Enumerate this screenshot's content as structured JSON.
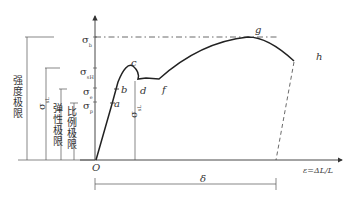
{
  "diagram": {
    "type": "stress-strain curve",
    "origin_label": "O",
    "x_axis_label": "ε=ΔL/L",
    "elongation_label": "δ",
    "points": [
      "a",
      "b",
      "c",
      "d",
      "f",
      "g",
      "h"
    ],
    "y_labels": {
      "sigma_b": {
        "sym": "σ",
        "sub": "b"
      },
      "sigma_sH": {
        "sym": "σ",
        "sub": "sH"
      },
      "sigma_e": {
        "sym": "σ",
        "sub": "e"
      },
      "sigma_p": {
        "sym": "σ",
        "sub": "p"
      },
      "sigma_sL": {
        "sym": "σ",
        "sub": "sL"
      }
    },
    "limit_labels": {
      "strength_limit": "强度极限",
      "yield_sl": {
        "sym": "σ",
        "sub": "sL"
      },
      "elastic_limit": "弹性极限",
      "proportional_limit": "比例极限"
    }
  }
}
